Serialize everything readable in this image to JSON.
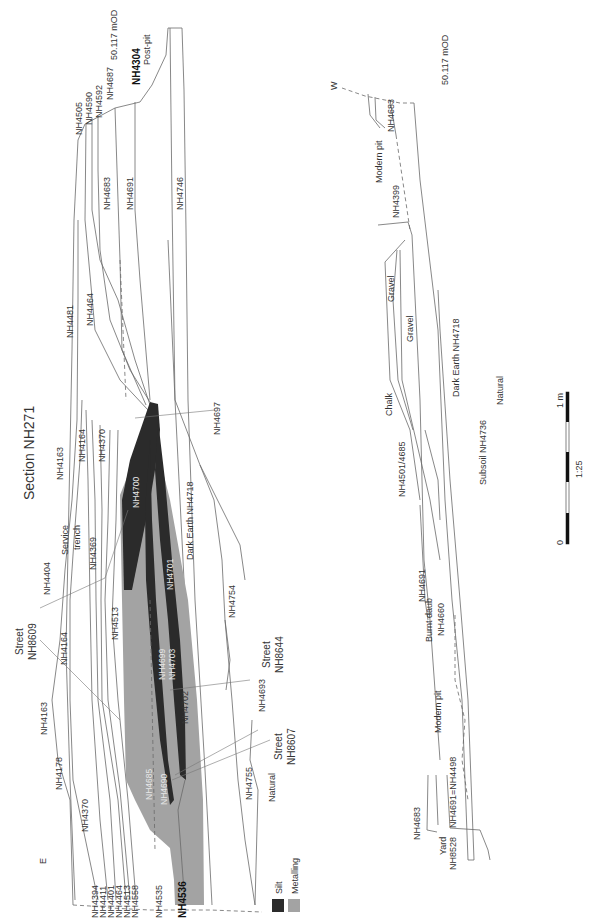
{
  "title": "Section NH271",
  "colors": {
    "silt": "#2b2b2b",
    "metalling": "#a3a3a3",
    "line": "#6a6a6a",
    "background": "#ffffff"
  },
  "orientation": {
    "east": "E",
    "west": "W"
  },
  "datum": {
    "main": "50.117 mOD",
    "second": "50.117 mOD"
  },
  "main_section": {
    "top_labels": {
      "nh4505": "NH4505",
      "nh4590": "NH4590",
      "nh4592": "NH4592",
      "nh4687": "NH4687",
      "nh4304": "NH4304",
      "post_pit": "Post-pit",
      "nh4683": "NH4683",
      "nh4691": "NH4691",
      "nh4746": "NH4746",
      "nh4481": "NH4481",
      "nh4464": "NH4464",
      "nh4697": "NH4697"
    },
    "middle_labels": {
      "nh4163a": "NH4163",
      "nh4164a": "NH4164",
      "nh4370a": "NH4370",
      "service": "Service",
      "trench": "trench",
      "nh4369": "NH4369",
      "nh4404": "NH4404",
      "nh4513": "NH4513",
      "nh4164b": "NH4164",
      "street1": "Street",
      "nh8609": "NH8609",
      "dark_earth": "Dark  Earth NH4718",
      "nh4754": "NH4754",
      "street2": "Street",
      "nh8644": "NH8644",
      "nh4699": "NH4699",
      "nh4700": "NH4700",
      "nh4701": "NH4701",
      "nh4703": "NH4703"
    },
    "bottom_labels": {
      "nh4163b": "NH4163",
      "nh4178": "NH4178",
      "nh4370b": "NH4370",
      "nh4702": "NH4702",
      "nh4693": "NH4693",
      "street3": "Street",
      "nh8607": "NH8607",
      "nh4685": "NH4685",
      "nh4690": "NH4690",
      "nh4755": "NH4755",
      "natural": "Natural"
    },
    "base_labels": [
      "NH4394",
      "NH4411",
      "NH4401",
      "NH4464",
      "NH4513",
      "NH4558",
      "NH4535"
    ],
    "base_bold": "NH4536"
  },
  "legend": {
    "silt": "Silt",
    "metalling": "Metalling"
  },
  "second_section": {
    "nh4683a": "NH4683",
    "modern_pit_a": "Modern pit",
    "nh4399": "NH4399",
    "gravel1": "Gravel",
    "gravel2": "Gravel",
    "dark_earth": "Dark Earth NH4718",
    "chalk": "Chalk",
    "natural": "Natural",
    "nh4501": "NH4501/4685",
    "subsoil": "Subsoil NH4736",
    "nh4691": "NH4691",
    "burnt_daub": "Burnt daub",
    "nh4660": "NH4660",
    "modern_pit_b": "Modern pit",
    "nh4683b": "NH4683",
    "nh4691eq": "NH4691=NH4498",
    "yard": "Yard",
    "nh8528": "NH8528"
  },
  "scale_bar": {
    "zero": "0",
    "one": "1 m",
    "ratio": "1:25"
  }
}
